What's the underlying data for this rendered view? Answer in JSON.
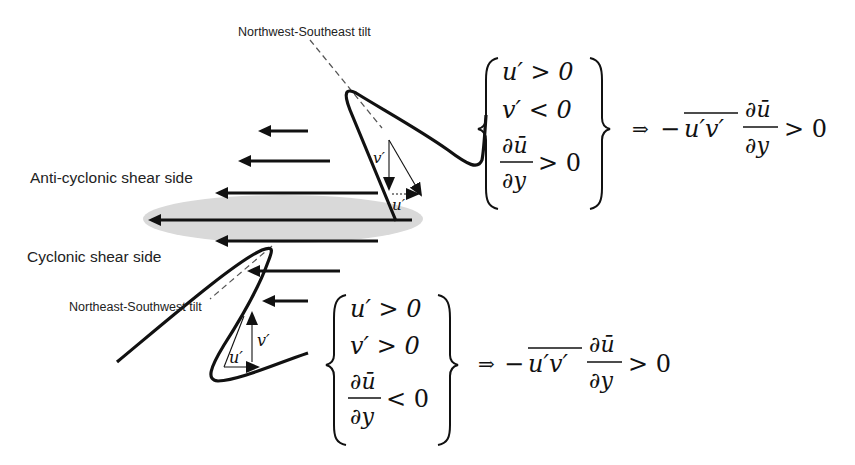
{
  "diagram": {
    "type": "eddy-shear-tilt-schematic",
    "background": "#ffffff",
    "colors": {
      "ink": "#111111",
      "jet_core_fill": "#d9d9d9",
      "dashed_axis": "#555555",
      "label": "#222222"
    },
    "labels": {
      "nw_se_tilt": "Northwest-Southeast tilt",
      "ne_sw_tilt": "Northeast-Southwest tilt",
      "anticyclonic_side": "Anti-cyclonic shear side",
      "cyclonic_side": "Cyclonic shear side"
    },
    "mean_flow_arrows": [
      {
        "x1": 308,
        "y1": 131,
        "x2": 258,
        "y2": 131
      },
      {
        "x1": 330,
        "y1": 161,
        "x2": 238,
        "y2": 161
      },
      {
        "x1": 378,
        "y1": 193,
        "x2": 215,
        "y2": 193
      },
      {
        "x1": 412,
        "y1": 220,
        "x2": 148,
        "y2": 220
      },
      {
        "x1": 378,
        "y1": 241,
        "x2": 215,
        "y2": 241
      },
      {
        "x1": 340,
        "y1": 271,
        "x2": 247,
        "y2": 271
      },
      {
        "x1": 308,
        "y1": 301,
        "x2": 262,
        "y2": 301
      }
    ],
    "upper_eddy": {
      "vector_labels": {
        "v": "v′",
        "u": "u′"
      },
      "conditions": [
        {
          "lhs": "u′",
          "op": ">",
          "rhs": "0"
        },
        {
          "lhs": "v′",
          "op": "<",
          "rhs": "0"
        },
        {
          "lhs_num": "∂ū",
          "lhs_den": "∂y",
          "op": ">",
          "rhs": "0"
        }
      ],
      "implies": "⇒",
      "result": {
        "sign": "−",
        "flux": "u′v′",
        "num": "∂ū",
        "den": "∂y",
        "op": ">",
        "rhs": "0"
      }
    },
    "lower_eddy": {
      "vector_labels": {
        "v": "v′",
        "u": "u′"
      },
      "conditions": [
        {
          "lhs": "u′",
          "op": ">",
          "rhs": "0"
        },
        {
          "lhs": "v′",
          "op": ">",
          "rhs": "0"
        },
        {
          "lhs_num": "∂ū",
          "lhs_den": "∂y",
          "op": "<",
          "rhs": "0"
        }
      ],
      "implies": "⇒",
      "result": {
        "sign": "−",
        "flux": "u′v′",
        "num": "∂ū",
        "den": "∂y",
        "op": ">",
        "rhs": "0"
      }
    }
  }
}
